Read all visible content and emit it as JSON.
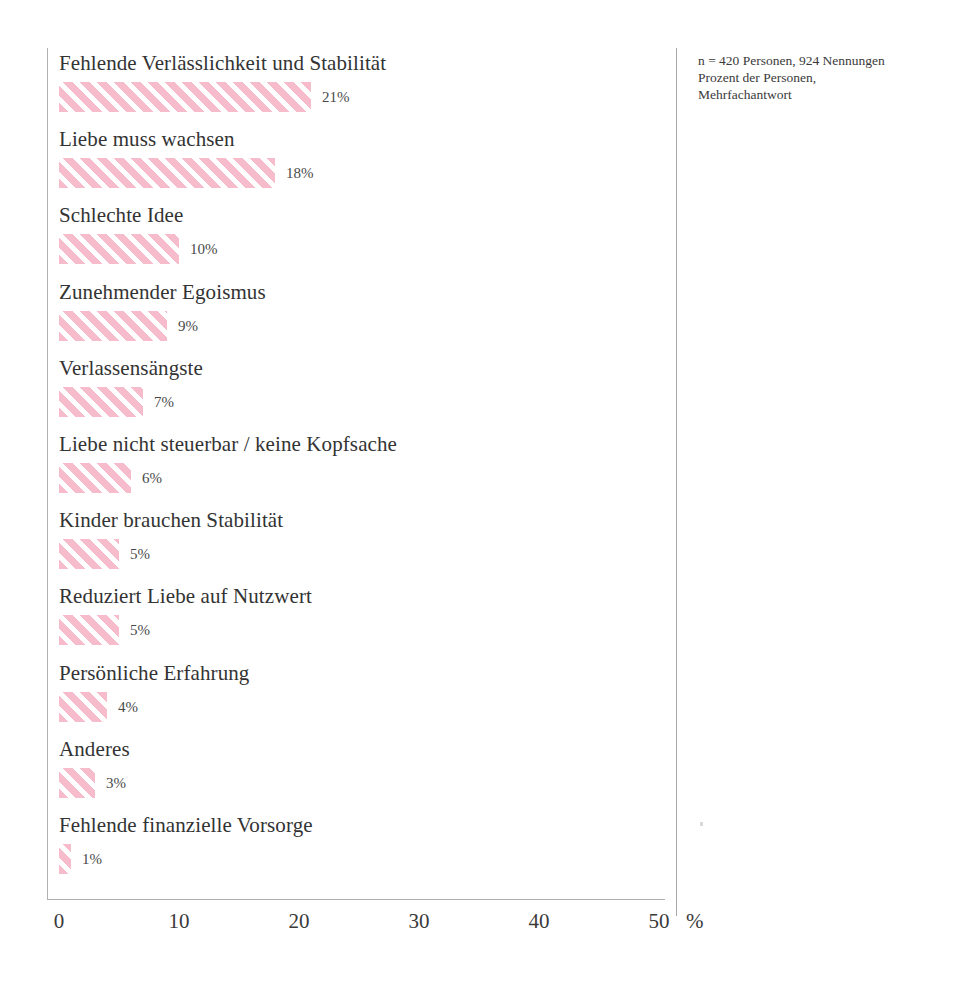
{
  "chart_data": {
    "type": "bar",
    "orientation": "horizontal",
    "title": "",
    "xlabel": "%",
    "ylabel": "",
    "xlim": [
      0,
      50
    ],
    "xticks": [
      "0",
      "10",
      "20",
      "30",
      "40",
      "50"
    ],
    "grid": false,
    "legend": null,
    "bar_color": "#f7bccb",
    "bar_fill_pattern": "diagonal-hatch",
    "categories": [
      "Fehlende Verlässlichkeit und Stabilität",
      "Liebe muss wachsen",
      "Schlechte Idee",
      "Zunehmender Egoismus",
      "Verlassensängste",
      "Liebe nicht steuerbar / keine Kopfsache",
      "Kinder brauchen Stabilität",
      "Reduziert Liebe auf Nutzwert",
      "Persönliche Erfahrung",
      "Anderes",
      "Fehlende finanzielle Vorsorge"
    ],
    "values": [
      21,
      18,
      10,
      9,
      7,
      6,
      5,
      5,
      4,
      3,
      1
    ],
    "value_labels": [
      "21%",
      "18%",
      "10%",
      "9%",
      "7%",
      "6%",
      "5%",
      "5%",
      "4%",
      "3%",
      "1%"
    ]
  },
  "note": {
    "line1": "n = 420 Personen, 924 Nennungen",
    "line2": "Prozent der Personen,",
    "line3": "Mehrfachantwort"
  }
}
